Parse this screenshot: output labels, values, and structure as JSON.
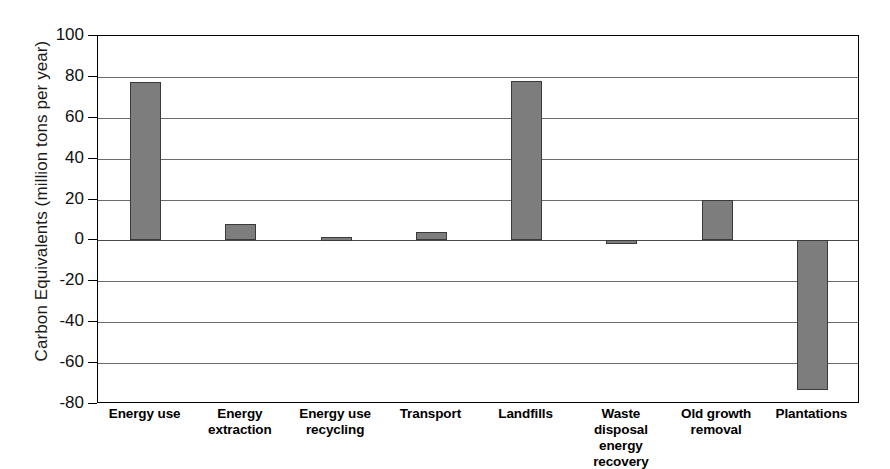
{
  "chart_data": {
    "type": "bar",
    "title": "",
    "xlabel": "",
    "ylabel": "Carbon Equivalents (million tons per  year)",
    "ylim": [
      -80,
      100
    ],
    "ytick_values": [
      100,
      80,
      60,
      40,
      20,
      0,
      -20,
      -40,
      -60,
      -80
    ],
    "ytick_labels": [
      "100",
      "80",
      "60",
      "40",
      "20",
      "0",
      "-20",
      "-40",
      "-60",
      "-80"
    ],
    "grid": true,
    "legend": false,
    "bar_color": "#7d7d7d",
    "bar_edge_color": "#3a3a3a",
    "categories": [
      "Energy use",
      "Energy extraction",
      "Energy use recycling",
      "Transport",
      "Landfills",
      "Waste disposal energy recovery",
      "Old growth removal",
      "Plantations"
    ],
    "category_lines": [
      [
        "Energy use",
        ""
      ],
      [
        "Energy",
        "extraction"
      ],
      [
        "Energy use",
        "recycling"
      ],
      [
        "Transport",
        ""
      ],
      [
        "Landfills",
        ""
      ],
      [
        "Waste disposal",
        "energy recovery"
      ],
      [
        "Old growth",
        "removal"
      ],
      [
        "Plantations",
        ""
      ]
    ],
    "values": [
      77.5,
      8,
      1.5,
      4,
      78,
      -1.5,
      20,
      -73
    ]
  }
}
